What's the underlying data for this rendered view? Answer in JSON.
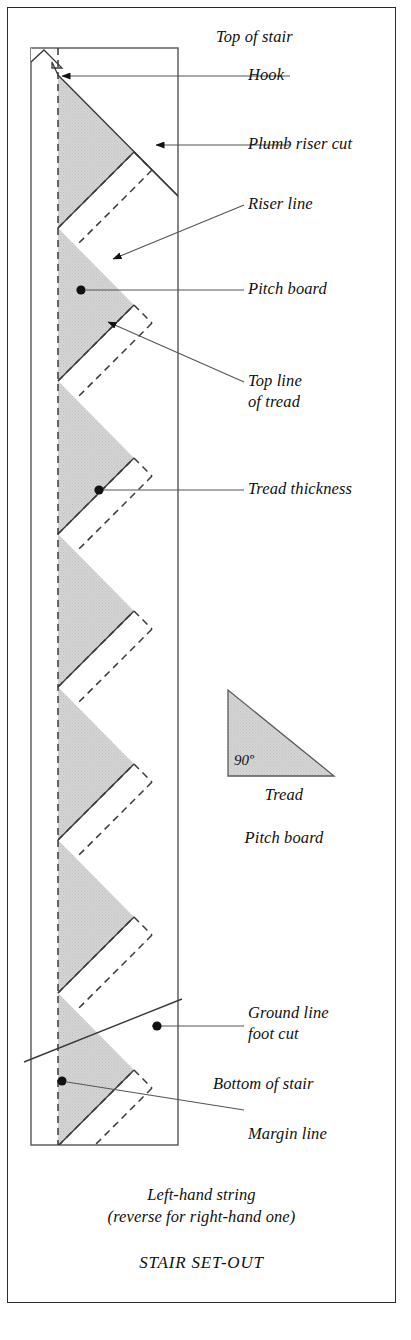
{
  "figure": {
    "caption_line1": "Left-hand string",
    "caption_line2": "(reverse for right-hand one)",
    "title": "STAIR SET-OUT"
  },
  "labels": {
    "top_of_stair": "Top of stair",
    "hook": "Hook",
    "plumb_riser_cut": "Plumb riser cut",
    "riser_line": "Riser line",
    "pitch_board": "Pitch board",
    "top_line_of_tread_1": "Top line",
    "top_line_of_tread_2": "of tread",
    "tread_thickness": "Tread thickness",
    "ground_line_1": "Ground line",
    "ground_line_2": "foot cut",
    "bottom_of_stair": "Bottom of stair",
    "margin_line": "Margin line"
  },
  "legend": {
    "angle": "90º",
    "tread": "Tread",
    "pitch_board": "Pitch board"
  },
  "colors": {
    "ink": "#2b2b2b",
    "shade": "#d2d2d2",
    "shade_edge": "#6e6e6e",
    "leader": "#555555",
    "page": "#ffffff"
  },
  "geometry": {
    "board_left": 31,
    "board_right": 178,
    "board_top": 48,
    "board_bottom": 1145,
    "margin_line_x": 58,
    "step_pitch": 153,
    "first_notch_y": 228,
    "notch_count": 6
  }
}
